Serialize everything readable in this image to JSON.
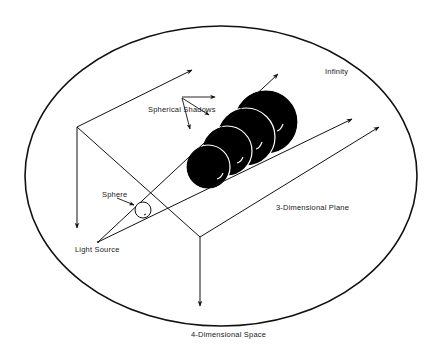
{
  "diagram": {
    "labels": {
      "infinity": "Infinity",
      "spherical_shadows": "Spherical Shadows",
      "sphere": "Sphere",
      "three_d_plane": "3-Dimensional Plane",
      "light_source": "Light Source",
      "four_d_space": "4-Dimensional Space"
    },
    "colors": {
      "ink": "#111111",
      "background": "#ffffff",
      "shadow_fill": "#000000",
      "shadow_outline": "#ffffff"
    }
  }
}
